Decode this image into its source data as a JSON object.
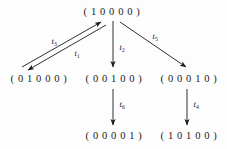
{
  "figure": {
    "type": "reachability-graph",
    "background_color": "#fdfdfd",
    "ink_color": "#1a1a1a",
    "width": 227,
    "height": 149
  },
  "nodes": [
    {
      "id": "n-10000",
      "label": "( 1 0 0 0 0 )",
      "x": 112,
      "y": 11
    },
    {
      "id": "n-01000",
      "label": "( 0 1 0 0 0 )",
      "x": 39,
      "y": 78
    },
    {
      "id": "n-00100",
      "label": "( 0 0 1 0 0 )",
      "x": 114,
      "y": 78
    },
    {
      "id": "n-00010",
      "label": "( 0 0 0 1 0 )",
      "x": 189,
      "y": 78
    },
    {
      "id": "n-00001",
      "label": "( 0 0 0 0 1 )",
      "x": 114,
      "y": 135
    },
    {
      "id": "n-10100",
      "label": "( 1 0 1 0 0 )",
      "x": 189,
      "y": 135
    }
  ],
  "edges": [
    {
      "id": "edge-t3",
      "label_text": "t",
      "label_sub": "3",
      "from": "n-01000",
      "to": "n-10000",
      "label_x": 54,
      "label_y": 41,
      "x1": 22,
      "y1": 67,
      "x2": 101,
      "y2": 22
    },
    {
      "id": "edge-t1",
      "label_text": "t",
      "label_sub": "1",
      "from": "n-10000",
      "to": "n-01000",
      "label_x": 77,
      "label_y": 53,
      "x1": 106,
      "y1": 25,
      "x2": 28,
      "y2": 70
    },
    {
      "id": "edge-t2",
      "label_text": "t",
      "label_sub": "2",
      "from": "n-10000",
      "to": "n-00100",
      "label_x": 122,
      "label_y": 47,
      "x1": 113,
      "y1": 21,
      "x2": 113,
      "y2": 67
    },
    {
      "id": "edge-t5",
      "label_text": "t",
      "label_sub": "5",
      "from": "n-10000",
      "to": "n-00010",
      "label_x": 155,
      "label_y": 36,
      "x1": 120,
      "y1": 22,
      "x2": 186,
      "y2": 67
    },
    {
      "id": "edge-t6",
      "label_text": "t",
      "label_sub": "6",
      "from": "n-00100",
      "to": "n-00001",
      "label_x": 122,
      "label_y": 104,
      "x1": 113,
      "y1": 89,
      "x2": 113,
      "y2": 125
    },
    {
      "id": "edge-t4",
      "label_text": "t",
      "label_sub": "4",
      "from": "n-00010",
      "to": "n-10100",
      "label_x": 196,
      "label_y": 104,
      "x1": 187,
      "y1": 89,
      "x2": 187,
      "y2": 125
    }
  ]
}
